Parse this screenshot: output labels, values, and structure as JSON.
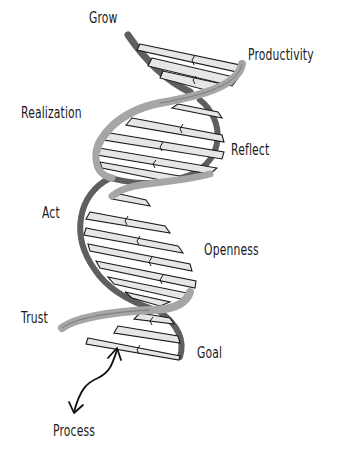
{
  "diagram": {
    "type": "dna-double-helix",
    "colors": {
      "strand_front": "#a6a6a6",
      "strand_back": "#5f5f5f",
      "rung_fill": "#e6e6e6",
      "rung_stroke": "#1a1a1a",
      "text": "#1a1a1a"
    },
    "labels": [
      {
        "id": "grow",
        "text": "Grow",
        "x": 89,
        "y": 11
      },
      {
        "id": "productivity",
        "text": "Productivity",
        "x": 248,
        "y": 48
      },
      {
        "id": "realization",
        "text": "Realization",
        "x": 21,
        "y": 106
      },
      {
        "id": "reflect",
        "text": "Reflect",
        "x": 231,
        "y": 143
      },
      {
        "id": "act",
        "text": "Act",
        "x": 42,
        "y": 206
      },
      {
        "id": "openness",
        "text": "Openness",
        "x": 204,
        "y": 243
      },
      {
        "id": "trust",
        "text": "Trust",
        "x": 21,
        "y": 311
      },
      {
        "id": "goal",
        "text": "Goal",
        "x": 197,
        "y": 346
      },
      {
        "id": "process",
        "text": "Process",
        "x": 53,
        "y": 424
      }
    ],
    "arrow": {
      "name": "double-headed-wavy-arrow",
      "from_label": "Process",
      "points_to": "helix"
    }
  }
}
